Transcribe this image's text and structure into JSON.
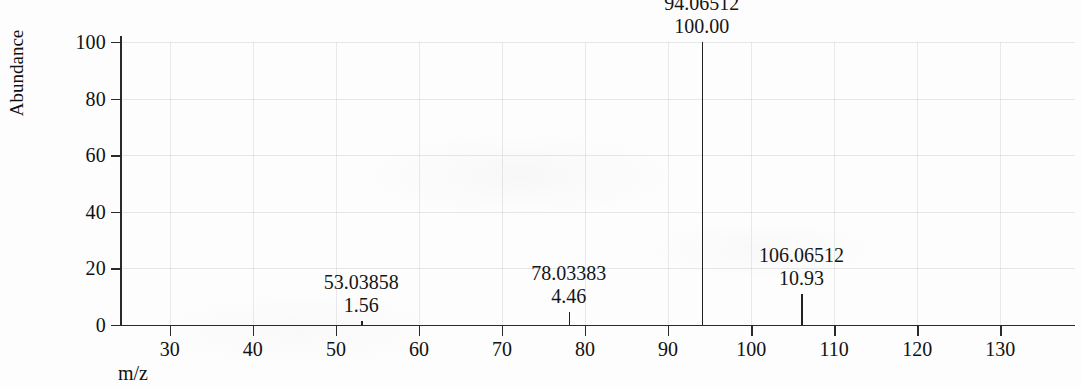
{
  "chart_data": {
    "type": "bar",
    "title": "",
    "subtitle": "",
    "xlabel": "m/z",
    "ylabel": "Abundance",
    "xlim": [
      24,
      139
    ],
    "ylim": [
      0,
      108
    ],
    "grid": true,
    "legend": false,
    "x_ticks": [
      30,
      40,
      50,
      60,
      70,
      80,
      90,
      100,
      110,
      120,
      130
    ],
    "x_tick_labels": [
      "30",
      "40",
      "50",
      "60",
      "70",
      "80",
      "90",
      "100",
      "110",
      "120",
      "130"
    ],
    "y_ticks": [
      0,
      20,
      40,
      60,
      80,
      100
    ],
    "y_tick_labels": [
      "0",
      "20",
      "40",
      "60",
      "80",
      "100"
    ],
    "peaks": [
      {
        "mz": 53.03858,
        "mz_label": "53.03858",
        "intensity": 1.56,
        "intensity_label": "1.56"
      },
      {
        "mz": 78.03383,
        "mz_label": "78.03383",
        "intensity": 4.46,
        "intensity_label": "4.46"
      },
      {
        "mz": 94.06512,
        "mz_label": "94.06512",
        "intensity": 100.0,
        "intensity_label": "100.00"
      },
      {
        "mz": 106.06512,
        "mz_label": "106.06512",
        "intensity": 10.93,
        "intensity_label": "10.93"
      }
    ],
    "series": [
      {
        "name": "mass spectrum",
        "x": [
          53.03858,
          78.03383,
          94.06512,
          106.06512
        ],
        "values": [
          1.56,
          4.46,
          100.0,
          10.93
        ]
      }
    ],
    "colors": {
      "peak": "#222222",
      "axis": "#2a2a2a",
      "grid": "#969ba5",
      "text": "#111111",
      "background": "#fdfdfd"
    }
  }
}
